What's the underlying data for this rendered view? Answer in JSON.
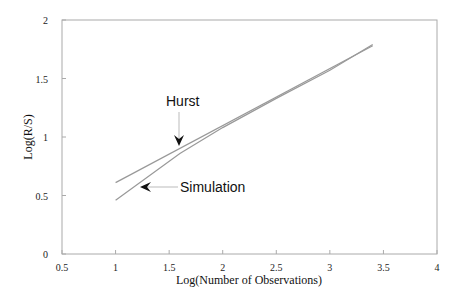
{
  "chart_data": {
    "type": "line",
    "title": "",
    "xlabel": "Log(Number of Observations)",
    "ylabel": "Log(R/S)",
    "xlim": [
      0.5,
      4
    ],
    "ylim": [
      0,
      2
    ],
    "xticks": [
      "0.5",
      "1",
      "1.5",
      "2",
      "2.5",
      "3",
      "3.5",
      "4"
    ],
    "yticks": [
      "0",
      "0.5",
      "1",
      "1.5",
      "2"
    ],
    "grid": false,
    "legend": "none (inline annotations with arrows)",
    "series": [
      {
        "name": "Hurst",
        "x": [
          1.0,
          3.4
        ],
        "y": [
          0.61,
          1.78
        ]
      },
      {
        "name": "Simulation",
        "x": [
          1.0,
          1.6,
          2.0,
          2.5,
          3.0,
          3.4
        ],
        "y": [
          0.46,
          0.86,
          1.08,
          1.33,
          1.57,
          1.79
        ]
      }
    ],
    "annotations": [
      {
        "text": "Hurst",
        "arrow_to": [
          1.6,
          0.89
        ]
      },
      {
        "text": "Simulation",
        "arrow_to": [
          1.22,
          0.59
        ]
      }
    ]
  }
}
